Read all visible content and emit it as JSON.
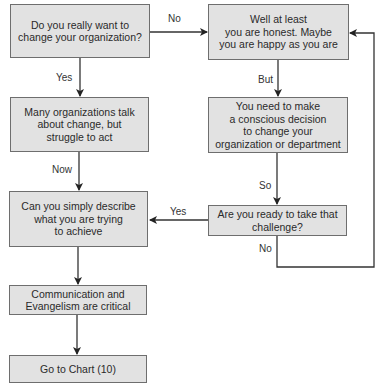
{
  "diagram": {
    "type": "flowchart",
    "nodes": [
      {
        "id": "q1",
        "text": "Do you really want to\nchange your organization?"
      },
      {
        "id": "honest",
        "text": "Well at least\nyou are honest. Maybe\nyou are happy as you are"
      },
      {
        "id": "talk",
        "text": "Many organizations talk\nabout change, but\nstruggle to act"
      },
      {
        "id": "decision",
        "text": "You need to make\na conscious decision\nto change your\norganization or department"
      },
      {
        "id": "describe",
        "text": "Can you simply describe\nwhat you are trying\nto achieve"
      },
      {
        "id": "ready",
        "text": "Are you ready to take that\nchallenge?"
      },
      {
        "id": "comm",
        "text": "Communication and\nEvangelism are critical"
      },
      {
        "id": "goto",
        "text": "Go to Chart (10)"
      }
    ],
    "edges": [
      {
        "from": "q1",
        "to": "honest",
        "label": "No"
      },
      {
        "from": "q1",
        "to": "talk",
        "label": "Yes"
      },
      {
        "from": "honest",
        "to": "decision",
        "label": "But"
      },
      {
        "from": "talk",
        "to": "describe",
        "label": "Now"
      },
      {
        "from": "decision",
        "to": "ready",
        "label": "So"
      },
      {
        "from": "ready",
        "to": "describe",
        "label": "Yes"
      },
      {
        "from": "ready",
        "to": "honest",
        "label": "No"
      },
      {
        "from": "describe",
        "to": "comm",
        "label": ""
      },
      {
        "from": "comm",
        "to": "goto",
        "label": ""
      }
    ]
  },
  "colors": {
    "box_fill": "#e2e2e2",
    "box_border": "#6e6e6e",
    "line": "#333333"
  }
}
